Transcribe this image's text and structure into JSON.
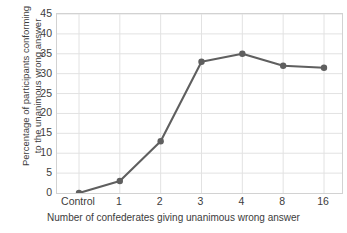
{
  "chart_data": {
    "type": "line",
    "title": "",
    "xlabel": "Number of confederates giving unanimous wrong answer",
    "ylabel_line1": "Percentage of participants conforming",
    "ylabel_line2": "to the unanimous wrong answer",
    "categories": [
      "Control",
      "1",
      "2",
      "3",
      "4",
      "8",
      "16"
    ],
    "values": [
      0,
      3,
      13,
      33,
      35,
      32,
      31.5
    ],
    "series": [
      {
        "name": "Percentage conforming",
        "values": [
          0,
          3,
          13,
          33,
          35,
          32,
          31.5
        ]
      }
    ],
    "ylim": [
      0,
      45
    ],
    "ytick_values": [
      0,
      5,
      10,
      15,
      20,
      25,
      30,
      35,
      40,
      45
    ],
    "ytick_labels": [
      "0",
      "5",
      "10",
      "15",
      "20",
      "25",
      "30",
      "35",
      "40",
      "45"
    ],
    "xtick_labels": [
      "Control",
      "1",
      "2",
      "3",
      "4",
      "8",
      "16"
    ],
    "grid": true,
    "grid_x": true,
    "grid_y": true,
    "legend": "none",
    "colors": {
      "line": "#5f5f5f",
      "marker": "#5f5f5f",
      "grid": "#e2e2e2",
      "frame": "#d2d2d2",
      "text": "#3c3c3c",
      "background": "#ffffff"
    },
    "marker_radius": 3.2,
    "line_width": 2.1
  }
}
